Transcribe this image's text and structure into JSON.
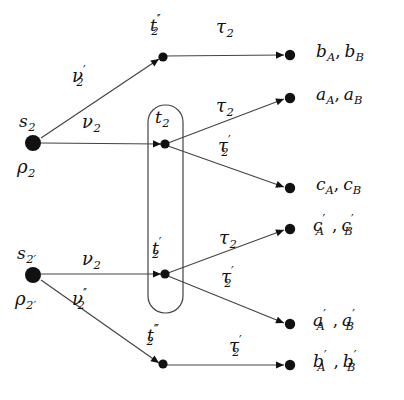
{
  "figure": {
    "type": "petri-net-diagram",
    "width": 404,
    "height": 400,
    "background": "#ffffff",
    "ink": "#111111",
    "line_color": "#444444"
  },
  "sources": [
    {
      "id": "s2",
      "dot": {
        "x": 33,
        "y": 143,
        "r": 8
      },
      "top_label": {
        "base": "s",
        "sub": "2",
        "x": 19,
        "y": 113
      },
      "bottom_label": {
        "base": "ρ",
        "sub": "2",
        "x": 17,
        "y": 158
      }
    },
    {
      "id": "s2p",
      "dot": {
        "x": 33,
        "y": 275,
        "r": 8
      },
      "top_label": {
        "base": "s",
        "sub": "2′",
        "x": 17,
        "y": 245
      },
      "bottom_label": {
        "base": "ρ",
        "sub": "2′",
        "x": 15,
        "y": 290
      }
    }
  ],
  "transitions": [
    {
      "id": "t2pp",
      "label_base": "t",
      "primes": "′′",
      "sub": "2",
      "dot": {
        "x": 163,
        "y": 57
      },
      "label_x": 150,
      "label_y": 17
    },
    {
      "id": "t2",
      "label_base": "t",
      "primes": "",
      "sub": "2",
      "dot": {
        "x": 165,
        "y": 144
      },
      "label_x": 155,
      "label_y": 109
    },
    {
      "id": "t2p",
      "label_base": "t",
      "primes": "′",
      "sub": "2",
      "dot": {
        "x": 165,
        "y": 274
      },
      "label_x": 152,
      "label_y": 240
    },
    {
      "id": "t2ppp",
      "label_base": "t",
      "primes": "′′′",
      "sub": "2",
      "dot": {
        "x": 163,
        "y": 364
      },
      "label_x": 147,
      "label_y": 327
    }
  ],
  "container_box": {
    "name": "place-group-box",
    "x": 148,
    "y": 105,
    "width": 35,
    "height": 208,
    "radius": 17
  },
  "places": [
    {
      "id": "p_b",
      "dot": {
        "x": 290,
        "y": 55
      },
      "text_x": 316,
      "text_y": 43,
      "items": [
        {
          "base": "b",
          "prime": "",
          "cal": "A"
        },
        {
          "base": "b",
          "prime": "",
          "cal": "B"
        }
      ]
    },
    {
      "id": "p_a",
      "dot": {
        "x": 290,
        "y": 98
      },
      "text_x": 316,
      "text_y": 86,
      "items": [
        {
          "base": "a",
          "prime": "",
          "cal": "A"
        },
        {
          "base": "a",
          "prime": "",
          "cal": "B"
        }
      ]
    },
    {
      "id": "p_c",
      "dot": {
        "x": 290,
        "y": 188
      },
      "text_x": 316,
      "text_y": 176,
      "items": [
        {
          "base": "c",
          "prime": "",
          "cal": "A"
        },
        {
          "base": "c",
          "prime": "",
          "cal": "B"
        }
      ]
    },
    {
      "id": "p_cp",
      "dot": {
        "x": 290,
        "y": 229
      },
      "text_x": 313,
      "text_y": 217,
      "items": [
        {
          "base": "c",
          "prime": "′",
          "cal": "A"
        },
        {
          "base": "c",
          "prime": "′",
          "cal": "B"
        }
      ]
    },
    {
      "id": "p_ap",
      "dot": {
        "x": 290,
        "y": 324
      },
      "text_x": 313,
      "text_y": 312,
      "items": [
        {
          "base": "a",
          "prime": "′",
          "cal": "A"
        },
        {
          "base": "a",
          "prime": "′",
          "cal": "B"
        }
      ]
    },
    {
      "id": "p_bp",
      "dot": {
        "x": 290,
        "y": 365
      },
      "text_x": 313,
      "text_y": 353,
      "items": [
        {
          "base": "b",
          "prime": "′",
          "cal": "A"
        },
        {
          "base": "b",
          "prime": "′",
          "cal": "B"
        }
      ]
    }
  ],
  "arcs": [
    {
      "id": "arc-s2-t2pp",
      "from": "s2",
      "to": "t2pp",
      "x1": 41,
      "y1": 138,
      "x2": 159,
      "y2": 59
    },
    {
      "id": "arc-s2-t2",
      "from": "s2",
      "to": "t2",
      "x1": 41,
      "y1": 143,
      "x2": 161,
      "y2": 144
    },
    {
      "id": "arc-s2p-t2p",
      "from": "s2p",
      "to": "t2p",
      "x1": 41,
      "y1": 274,
      "x2": 161,
      "y2": 274
    },
    {
      "id": "arc-s2p-t2ppp",
      "from": "s2p",
      "to": "t2ppp",
      "x1": 41,
      "y1": 280,
      "x2": 159,
      "y2": 363
    },
    {
      "id": "arc-t2pp-b",
      "from": "t2pp",
      "to": "p_b",
      "x1": 163,
      "y1": 56,
      "x2": 284,
      "y2": 55
    },
    {
      "id": "arc-t2-a",
      "from": "t2",
      "to": "p_a",
      "x1": 168,
      "y1": 143,
      "x2": 284,
      "y2": 99
    },
    {
      "id": "arc-t2-c",
      "from": "t2",
      "to": "p_c",
      "x1": 168,
      "y1": 146,
      "x2": 284,
      "y2": 187
    },
    {
      "id": "arc-t2p-cp",
      "from": "t2p",
      "to": "p_cp",
      "x1": 168,
      "y1": 273,
      "x2": 284,
      "y2": 230
    },
    {
      "id": "arc-t2p-ap",
      "from": "t2p",
      "to": "p_ap",
      "x1": 168,
      "y1": 276,
      "x2": 284,
      "y2": 323
    },
    {
      "id": "arc-t2ppp-bp",
      "from": "t2ppp",
      "to": "p_bp",
      "x1": 163,
      "y1": 365,
      "x2": 284,
      "y2": 365
    }
  ],
  "arc_labels": [
    {
      "id": "lbl-nu2p",
      "base": "ν",
      "primes": "′",
      "sub": "2",
      "x": 72,
      "y": 67,
      "cluster": "wide"
    },
    {
      "id": "lbl-nu2",
      "base": "ν",
      "primes": "",
      "sub": "2",
      "x": 82,
      "y": 113,
      "cluster": ""
    },
    {
      "id": "lbl-nu2b",
      "base": "ν",
      "primes": "",
      "sub": "2",
      "x": 82,
      "y": 250,
      "cluster": ""
    },
    {
      "id": "lbl-nu2pp",
      "base": "ν",
      "primes": "′′",
      "sub": "2",
      "x": 72,
      "y": 290,
      "cluster": "wide"
    },
    {
      "id": "lbl-tau2a",
      "base": "τ",
      "primes": "",
      "sub": "2",
      "x": 216,
      "y": 97,
      "cluster": ""
    },
    {
      "id": "lbl-tau2pa",
      "base": "τ",
      "primes": "′",
      "sub": "2",
      "x": 218,
      "y": 137,
      "cluster": "wide"
    },
    {
      "id": "lbl-tau2b",
      "base": "τ",
      "primes": "",
      "sub": "2",
      "x": 219,
      "y": 229,
      "cluster": ""
    },
    {
      "id": "lbl-tau2pb",
      "base": "τ",
      "primes": "′",
      "sub": "2",
      "x": 221,
      "y": 268,
      "cluster": "wide"
    },
    {
      "id": "lbl-tau2pc",
      "base": "τ",
      "primes": "′",
      "sub": "2",
      "x": 229,
      "y": 337,
      "cluster": "wide"
    },
    {
      "id": "lbl-tau2pp",
      "base": "τ",
      "primes": "",
      "sub": "2",
      "x": 216,
      "y": 18,
      "cluster": ""
    }
  ]
}
